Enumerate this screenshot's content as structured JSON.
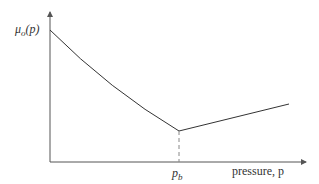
{
  "diagram": {
    "y_axis_label": "μo(p)",
    "y_axis_label_base": "μ",
    "y_axis_label_sub": "o",
    "y_axis_label_arg": "(p)",
    "x_axis_label": "pressure, p",
    "breakpoint_label_base": "p",
    "breakpoint_label_sub": "b",
    "breakpoint_label": "p_b",
    "curve_color": "#333333",
    "axis_color": "#555555",
    "dash_color": "#888888",
    "segments": [
      {
        "name": "below-bubble-point",
        "shape": "concave decreasing curve",
        "from": "y-axis high value",
        "to": "p_b minimum"
      },
      {
        "name": "above-bubble-point",
        "shape": "linear increasing",
        "from": "p_b minimum",
        "to": "right edge"
      }
    ]
  }
}
